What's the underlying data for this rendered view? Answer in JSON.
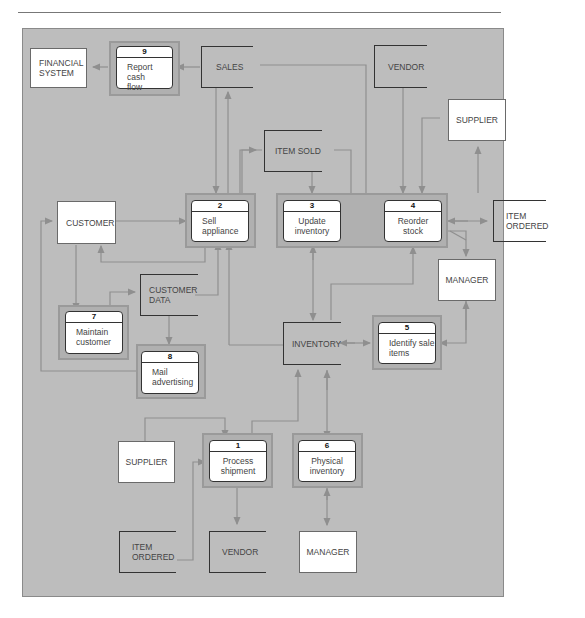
{
  "diagram": {
    "type": "data-flow-diagram",
    "processes": [
      {
        "id": "p9",
        "number": "9",
        "label": "Report cash flow"
      },
      {
        "id": "p2",
        "number": "2",
        "label": "Sell appliance"
      },
      {
        "id": "p3",
        "number": "3",
        "label": "Update inventory"
      },
      {
        "id": "p4",
        "number": "4",
        "label": "Reorder stock"
      },
      {
        "id": "p7",
        "number": "7",
        "label": "Maintain customer"
      },
      {
        "id": "p8",
        "number": "8",
        "label": "Mail advertising"
      },
      {
        "id": "p5",
        "number": "5",
        "label": "Identify sale items"
      },
      {
        "id": "p1",
        "number": "1",
        "label": "Process shipment"
      },
      {
        "id": "p6",
        "number": "6",
        "label": "Physical inventory"
      }
    ],
    "external_entities": [
      {
        "id": "e_fin",
        "label": "FINANCIAL SYSTEM"
      },
      {
        "id": "e_supplier_top",
        "label": "SUPPLIER"
      },
      {
        "id": "e_customer",
        "label": "CUSTOMER"
      },
      {
        "id": "e_manager_mid",
        "label": "MANAGER"
      },
      {
        "id": "e_supplier_bottom",
        "label": "SUPPLIER"
      },
      {
        "id": "e_manager_bottom",
        "label": "MANAGER"
      }
    ],
    "data_stores": [
      {
        "id": "s_sales",
        "label": "SALES"
      },
      {
        "id": "s_vendor_top",
        "label": "VENDOR"
      },
      {
        "id": "s_item_sold",
        "label": "ITEM SOLD"
      },
      {
        "id": "s_item_ordered_right",
        "label": "ITEM ORDERED"
      },
      {
        "id": "s_customer_data",
        "label": "CUSTOMER DATA"
      },
      {
        "id": "s_inventory",
        "label": "INVENTORY"
      },
      {
        "id": "s_item_ordered_bottom",
        "label": "ITEM ORDERED"
      },
      {
        "id": "s_vendor_bottom",
        "label": "VENDOR"
      }
    ],
    "flows": [
      {
        "from": "p9",
        "to": "e_fin"
      },
      {
        "from": "s_sales",
        "to": "p9"
      },
      {
        "from": "s_sales",
        "to": "p2"
      },
      {
        "from": "p2",
        "to": "s_sales"
      },
      {
        "from": "s_sales",
        "to": "p4"
      },
      {
        "from": "p2",
        "to": "s_item_sold"
      },
      {
        "from": "s_item_sold",
        "to": "p2"
      },
      {
        "from": "s_item_sold",
        "to": "p3"
      },
      {
        "from": "s_item_sold",
        "to": "p4"
      },
      {
        "from": "s_vendor_top",
        "to": "p4"
      },
      {
        "from": "e_supplier_top",
        "to": "p4"
      },
      {
        "from": "p4",
        "to": "e_supplier_top"
      },
      {
        "from": "e_customer",
        "to": "p2"
      },
      {
        "from": "p2",
        "to": "e_customer"
      },
      {
        "from": "p4",
        "to": "s_item_ordered_right"
      },
      {
        "from": "p4",
        "to": "e_manager_mid"
      },
      {
        "from": "e_manager_mid",
        "to": "p4"
      },
      {
        "from": "e_customer",
        "to": "p7"
      },
      {
        "from": "p7",
        "to": "s_customer_data"
      },
      {
        "from": "s_customer_data",
        "to": "p2"
      },
      {
        "from": "s_customer_data",
        "to": "p8"
      },
      {
        "from": "p8",
        "to": "e_customer"
      },
      {
        "from": "s_inventory",
        "to": "p2"
      },
      {
        "from": "p3",
        "to": "s_inventory"
      },
      {
        "from": "s_inventory",
        "to": "p4"
      },
      {
        "from": "s_inventory",
        "to": "p5"
      },
      {
        "from": "p5",
        "to": "s_inventory"
      },
      {
        "from": "e_manager_mid",
        "to": "p5"
      },
      {
        "from": "p5",
        "to": "e_manager_mid"
      },
      {
        "from": "e_supplier_bottom",
        "to": "p1"
      },
      {
        "from": "s_item_ordered_bottom",
        "to": "p1"
      },
      {
        "from": "p1",
        "to": "s_inventory"
      },
      {
        "from": "p1",
        "to": "s_vendor_bottom"
      },
      {
        "from": "s_inventory",
        "to": "p6"
      },
      {
        "from": "p6",
        "to": "s_inventory"
      },
      {
        "from": "p6",
        "to": "e_manager_bottom"
      }
    ]
  },
  "labels": {
    "p9_num": "9",
    "p9_l1": "Report cash",
    "p9_l2": "flow",
    "p2_num": "2",
    "p2_l1": "Sell",
    "p2_l2": "appliance",
    "p3_num": "3",
    "p3_l1": "Update",
    "p3_l2": "inventory",
    "p4_num": "4",
    "p4_l1": "Reorder",
    "p4_l2": "stock",
    "p7_num": "7",
    "p7_l1": "Maintain",
    "p7_l2": "customer",
    "p8_num": "8",
    "p8_l1": "Mail",
    "p8_l2": "advertising",
    "p5_num": "5",
    "p5_l1": "Identify sale",
    "p5_l2": "items",
    "p1_num": "1",
    "p1_l1": "Process",
    "p1_l2": "shipment",
    "p6_num": "6",
    "p6_l1": "Physical",
    "p6_l2": "inventory",
    "fin_l1": "FINANCIAL",
    "fin_l2": "SYSTEM",
    "sales": "SALES",
    "vendor_top": "VENDOR",
    "supplier_top": "SUPPLIER",
    "item_sold": "ITEM SOLD",
    "customer": "CUSTOMER",
    "item_ordered_r1": "ITEM",
    "item_ordered_r2": "ORDERED",
    "manager_mid": "MANAGER",
    "customer_data_l1": "CUSTOMER",
    "customer_data_l2": "DATA",
    "inventory": "INVENTORY",
    "supplier_bottom": "SUPPLIER",
    "item_ordered_b1": "ITEM",
    "item_ordered_b2": "ORDERED",
    "vendor_bottom": "VENDOR",
    "manager_bottom": "MANAGER"
  },
  "colors": {
    "panel": "#bdbdbd",
    "flow_line": "#8f8f8f",
    "entity_fill": "#ffffff",
    "store_border": "#333333"
  }
}
